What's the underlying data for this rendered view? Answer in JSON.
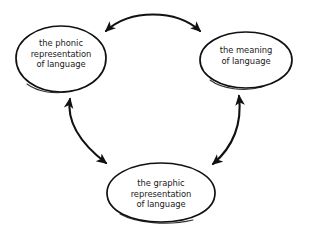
{
  "diagram": {
    "background_color": "#ffffff",
    "stroke_color": "#111111",
    "text_color": "#1a1a1a",
    "nodes": [
      {
        "id": "phonic",
        "lines": [
          "the phonic",
          "representation",
          "of language"
        ],
        "shape": "ellipse"
      },
      {
        "id": "meaning",
        "lines": [
          "the meaning",
          "of language"
        ],
        "shape": "ellipse"
      },
      {
        "id": "graphic",
        "lines": [
          "the graphic",
          "representation",
          "of language"
        ],
        "shape": "ellipse"
      }
    ],
    "connectors": [
      {
        "id": "phonic-meaning",
        "from": "phonic",
        "to": "meaning",
        "style": "curved",
        "arrowheads": "both"
      },
      {
        "id": "phonic-graphic",
        "from": "phonic",
        "to": "graphic",
        "style": "curved",
        "arrowheads": "both"
      },
      {
        "id": "graphic-meaning",
        "from": "graphic",
        "to": "meaning",
        "style": "curved",
        "arrowheads": "both"
      }
    ]
  }
}
